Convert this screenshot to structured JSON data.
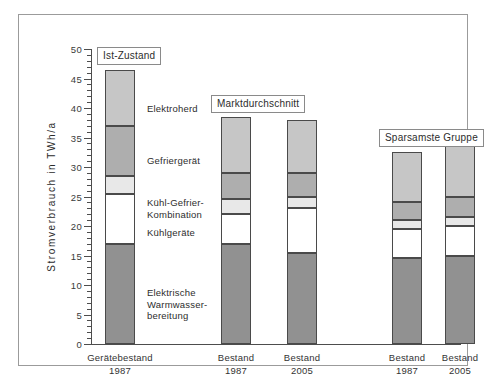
{
  "chart_data": {
    "type": "bar",
    "subtype": "stacked-bar",
    "title": "",
    "xlabel": "",
    "ylabel": "Stromverbrauch in TWh/a",
    "ylim": [
      0,
      50
    ],
    "ytick_step": 5,
    "yminor_step": 1,
    "grid": false,
    "legend_position": "inline-right-of-first-bar",
    "categories": [
      "Gerätebestand\n1987",
      "Bestand\n1987",
      "Bestand\n2005",
      "Bestand\n1987",
      "Bestand\n2005"
    ],
    "series": [
      {
        "name": "Elektrische Warmwasserbereitung",
        "values": [
          17.0,
          17.0,
          15.5,
          14.5,
          15.0
        ]
      },
      {
        "name": "Kühlgeräte",
        "values": [
          8.5,
          5.0,
          7.5,
          5.0,
          5.0
        ]
      },
      {
        "name": "Kühl-Gefrier-Kombination",
        "values": [
          3.0,
          2.5,
          2.0,
          1.5,
          1.5
        ]
      },
      {
        "name": "Gefriergerät",
        "values": [
          8.5,
          4.5,
          4.0,
          3.0,
          3.5
        ]
      },
      {
        "name": "Elektroherd",
        "values": [
          9.5,
          9.5,
          9.0,
          8.5,
          9.0
        ]
      }
    ],
    "totals": [
      46.5,
      38.5,
      38.0,
      32.5,
      33.0
    ],
    "colors": {
      "elektrische-warmwasserbereitung": "#919191",
      "kuehlgeraete": "#ffffff",
      "kuehl-gefrier-kombination": "#e8e8e8",
      "gefriergeraet": "#aeaeae",
      "elektroherd": "#c6c6c6",
      "outline": "#4a4a4a",
      "axis": "#4d4d4d",
      "frame": "#9b9b9b"
    }
  },
  "axis": {
    "y_title": "Stromverbrauch in TWh/a",
    "y_ticks": [
      "50",
      "45",
      "40",
      "35",
      "30",
      "25",
      "20",
      "15",
      "10",
      "5",
      "0"
    ]
  },
  "group_annotations": [
    {
      "label": "Ist-Zustand"
    },
    {
      "label": "Marktdurchschnitt"
    },
    {
      "label": "Sparsamste Gruppe"
    }
  ],
  "segment_labels": [
    {
      "text": "Elektroherd"
    },
    {
      "text": "Gefriergerät"
    },
    {
      "text": "Kühl-Gefrier-\nKombination"
    },
    {
      "text": "Kühlgeräte"
    },
    {
      "text": "Elektrische\nWarmwasser-\nbereitung"
    }
  ],
  "category_labels": [
    {
      "line1": "Gerätebestand",
      "line2": "1987"
    },
    {
      "line1": "Bestand",
      "line2": "1987"
    },
    {
      "line1": "Bestand",
      "line2": "2005"
    },
    {
      "line1": "Bestand",
      "line2": "1987"
    },
    {
      "line1": "Bestand",
      "line2": "2005"
    }
  ]
}
